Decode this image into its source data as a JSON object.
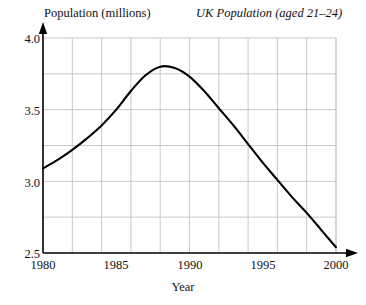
{
  "chart_data": {
    "type": "line",
    "title": "UK Population (aged 21–24)",
    "xlabel": "Year",
    "ylabel": "Population (millions)",
    "xlim": [
      1980,
      2000
    ],
    "ylim": [
      2.5,
      4.0
    ],
    "grid": true,
    "legend": null,
    "x_ticks": [
      "1980",
      "1985",
      "1990",
      "1995",
      "2000"
    ],
    "x_tick_values": [
      1980,
      1985,
      1990,
      1995,
      2000
    ],
    "y_ticks": [
      "4.0",
      "3.5",
      "3.0",
      "2.5"
    ],
    "y_tick_values": [
      4.0,
      3.5,
      3.0,
      2.5
    ],
    "x_gridline_values": [
      1982,
      1984,
      1986,
      1988,
      1990,
      1992,
      1994,
      1996,
      1998,
      2000
    ],
    "y_gridline_values": [
      3.75,
      3.5,
      3.25,
      3.0,
      2.75
    ],
    "series": [
      {
        "name": "UK population aged 21-24",
        "x": [
          1980,
          1981,
          1982,
          1983,
          1984,
          1985,
          1986,
          1987,
          1988,
          1989,
          1990,
          1991,
          1992,
          1993,
          1994,
          1995,
          1996,
          1997,
          1998,
          1999,
          2000
        ],
        "values": [
          3.09,
          3.15,
          3.22,
          3.3,
          3.39,
          3.5,
          3.63,
          3.74,
          3.8,
          3.79,
          3.73,
          3.63,
          3.51,
          3.39,
          3.26,
          3.13,
          3.01,
          2.89,
          2.78,
          2.66,
          2.54
        ]
      }
    ],
    "line_color": "#000000",
    "grid_color": "#c8c8c8",
    "axis_color": "#000000"
  },
  "axes": {
    "x_arrow": true,
    "y_arrow": true
  }
}
